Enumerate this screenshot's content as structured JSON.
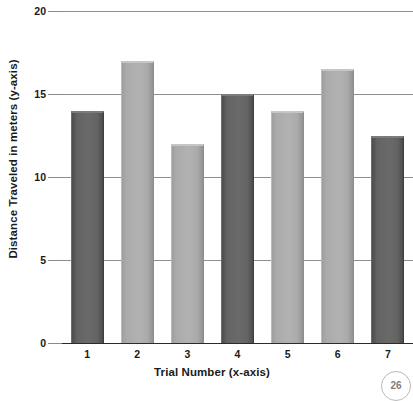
{
  "chart_data": {
    "type": "bar",
    "title": "",
    "xlabel": "Trial Number  (x-axis)",
    "ylabel": "Distance Traveled in meters  (y-axis)",
    "categories": [
      "1",
      "2",
      "3",
      "4",
      "5",
      "6",
      "7"
    ],
    "values": [
      14,
      17,
      12,
      15,
      14,
      16.5,
      12.5
    ],
    "ylim": [
      0,
      20
    ],
    "yticks": [
      0,
      5,
      10,
      15,
      20
    ],
    "ytick_labels": [
      "0",
      "5",
      "10",
      "15",
      "20"
    ],
    "grid": true,
    "legend": null,
    "bar_colors": [
      "#636363",
      "#ababab",
      "#ababab",
      "#636363",
      "#ababab",
      "#ababab",
      "#636363"
    ],
    "series": [
      {
        "name": "Distance Traveled",
        "values": [
          14,
          17,
          12,
          15,
          14,
          16.5,
          12.5
        ]
      }
    ]
  },
  "axes": {
    "y_ticks": [
      {
        "label": "20",
        "value": 20
      },
      {
        "label": "15",
        "value": 15
      },
      {
        "label": "10",
        "value": 10
      },
      {
        "label": "5",
        "value": 5
      },
      {
        "label": "0",
        "value": 0
      }
    ],
    "x_ticks": [
      {
        "label": "1"
      },
      {
        "label": "2"
      },
      {
        "label": "3"
      },
      {
        "label": "4"
      },
      {
        "label": "5"
      },
      {
        "label": "6"
      },
      {
        "label": "7"
      }
    ],
    "x_title": "Trial Number  (x-axis)",
    "y_title": "Distance Traveled in meters  (y-axis)"
  },
  "artifacts": {
    "page_badge": "26"
  },
  "colors": {
    "bar_dark": "#636363",
    "bar_light": "#ababab",
    "gridline": "#8f8f8f",
    "axis": "#2b2b2b",
    "text": "#1a1a1a",
    "background": "#ffffff"
  }
}
